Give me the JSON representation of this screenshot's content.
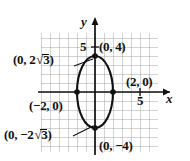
{
  "figure": {
    "type": "coordinate-plane-ellipse",
    "axes": {
      "x_label": "x",
      "y_label": "y",
      "x_tick_label": "5",
      "y_tick_label": "5",
      "x_tick_value": 5,
      "y_tick_value": 5,
      "origin_px": [
        95,
        92
      ],
      "unit_px": 9,
      "xlim": [
        -6,
        7
      ],
      "ylim": [
        -6.6,
        6.5
      ],
      "grid": true
    },
    "curve": {
      "shape": "ellipse",
      "center": [
        0,
        0
      ],
      "semi_axis_x": 2,
      "semi_axis_y": 4
    },
    "points": [
      {
        "name": "top-vertex",
        "coords": [
          0,
          4
        ],
        "label": "(0, 4)"
      },
      {
        "name": "upper-focus",
        "coords": [
          0,
          3.4641
        ],
        "label": "(0, 2√3)"
      },
      {
        "name": "right-covertex",
        "coords": [
          2,
          0
        ],
        "label": "(2, 0)"
      },
      {
        "name": "left-covertex",
        "coords": [
          -2,
          0
        ],
        "label": "(−2, 0)"
      },
      {
        "name": "lower-focus",
        "coords": [
          0,
          -3.4641
        ],
        "label": "(0, −2√3)"
      },
      {
        "name": "bottom-vertex",
        "coords": [
          0,
          -4
        ],
        "label": "(0, −4)"
      }
    ],
    "labels": {
      "top_vertex": "(0, 4)",
      "upper_focus_prefix": "(0, 2",
      "upper_focus_radicand": "3",
      "upper_focus_suffix": ")",
      "right_covertex": "(2, 0)",
      "left_covertex": "(−2, 0)",
      "lower_focus_prefix": "(0, −2",
      "lower_focus_radicand": "3",
      "lower_focus_suffix": ")",
      "bottom_vertex": "(0, −4)",
      "y_tick": "5",
      "x_tick": "5",
      "x_axis": "x",
      "y_axis": "y"
    },
    "colors": {
      "ink": "#111111",
      "grid": "#9a9a9a",
      "background": "#ffffff"
    }
  }
}
